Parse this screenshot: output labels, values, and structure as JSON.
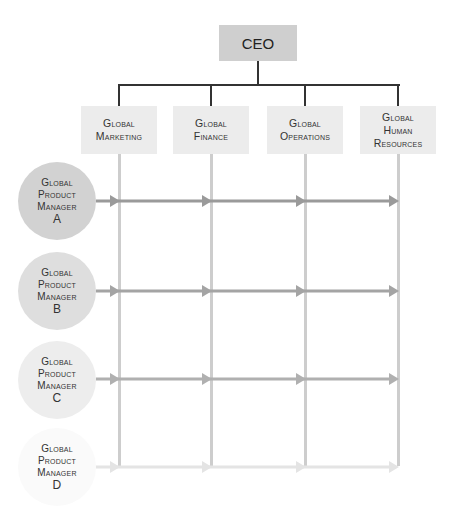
{
  "ceo": {
    "label": "CEO",
    "color": "#cfcfcf"
  },
  "departments": [
    {
      "lines": [
        "Global",
        "Marketing"
      ],
      "x": 81,
      "cx": 119
    },
    {
      "lines": [
        "Global",
        "Finance"
      ],
      "x": 173,
      "cx": 211
    },
    {
      "lines": [
        "Global",
        "Operations"
      ],
      "x": 267,
      "cx": 305
    },
    {
      "lines": [
        "Global",
        "Human",
        "Resources"
      ],
      "x": 360,
      "cx": 398
    }
  ],
  "product_managers": [
    {
      "lines": [
        "Global",
        "Product",
        "Manager"
      ],
      "letter": "A",
      "cy": 201,
      "fill": "#d2d2d2",
      "arrow_color": "#9a9a9a"
    },
    {
      "lines": [
        "Global",
        "Product",
        "Manager"
      ],
      "letter": "B",
      "cy": 291,
      "fill": "#dedede",
      "arrow_color": "#a4a4a4"
    },
    {
      "lines": [
        "Global",
        "Product",
        "Manager"
      ],
      "letter": "C",
      "cy": 380,
      "fill": "#ececec",
      "arrow_color": "#b0b0b0"
    },
    {
      "lines": [
        "Global",
        "Product",
        "Manager"
      ],
      "letter": "D",
      "cy": 467,
      "fill": "#f8f8f8",
      "arrow_color": "#e4e4e4"
    }
  ],
  "colors": {
    "connector": "#333333",
    "grid_line": "#cdcdcd",
    "dept_box": "#ececec"
  }
}
